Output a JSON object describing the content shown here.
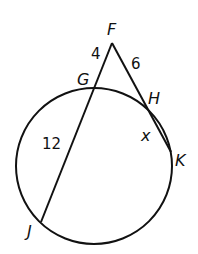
{
  "diagram": {
    "points": {
      "F": "F",
      "G": "G",
      "H": "H",
      "K": "K",
      "J": "J"
    },
    "segments": {
      "FG": "4",
      "FH": "6",
      "GJ": "12",
      "HK": "x"
    },
    "colors": {
      "stroke": "#111111",
      "background": "#ffffff"
    }
  }
}
